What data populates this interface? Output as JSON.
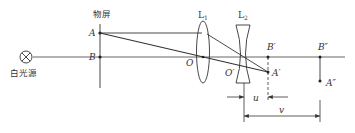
{
  "diagram": {
    "labels": {
      "screen": "物屏",
      "source": "白光源",
      "A": "A",
      "B": "B",
      "O": "O",
      "O_prime": "O′",
      "A_prime": "A′",
      "B_prime": "B′",
      "B_dprime": "B″",
      "A_dprime": "A″",
      "L1": "L",
      "L1_sub": "1",
      "L2": "L",
      "L2_sub": "2",
      "u": "u",
      "v": "v"
    },
    "colors": {
      "line": "#333333",
      "axis": "#555555"
    }
  }
}
